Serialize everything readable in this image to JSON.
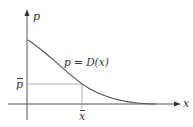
{
  "diagram": {
    "type": "demand-curve",
    "axes": {
      "y_label": "p",
      "x_label": "x"
    },
    "curve_label": "p = D(x)",
    "point_labels": {
      "p_bar": "p",
      "x_bar": "x"
    },
    "colors": {
      "axis": "#555555",
      "curve": "#555555",
      "guide": "#999999",
      "text": "#333333"
    }
  }
}
